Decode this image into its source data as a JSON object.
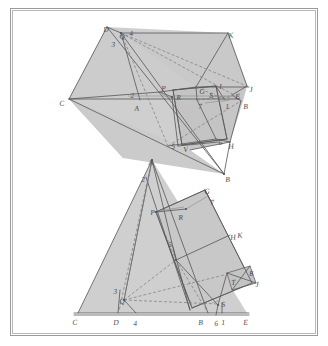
{
  "colors": {
    "paper": "#ffffff",
    "frame_outer": "#9a9a9a",
    "frame_inner": "#b8b8b8",
    "fill_gray": "#cfcfcf",
    "fill_gray_dark": "#c2c2c2",
    "stroke": "#555555",
    "stroke_light": "#808080",
    "label": "#4a4a4a"
  },
  "figures": [
    {
      "name": "upper-figure",
      "description": "Upper oblique projection: large quadrilateral prism with inscribed smaller prism and projection rays",
      "labels": [
        {
          "text": "D",
          "x": 103,
          "y": 26
        },
        {
          "text": "Q",
          "x": 119,
          "y": 33
        },
        {
          "text": "4",
          "x": 129,
          "y": 30
        },
        {
          "text": "3",
          "x": 111,
          "y": 41
        },
        {
          "text": "K",
          "x": 228,
          "y": 32
        },
        {
          "text": "C",
          "x": 59,
          "y": 100
        },
        {
          "text": "2",
          "x": 130,
          "y": 92
        },
        {
          "text": "A",
          "x": 134,
          "y": 105
        },
        {
          "text": "P",
          "x": 161,
          "y": 85
        },
        {
          "text": "R",
          "x": 176,
          "y": 94
        },
        {
          "text": "G",
          "x": 199,
          "y": 88
        },
        {
          "text": "S",
          "x": 209,
          "y": 92
        },
        {
          "text": "I",
          "x": 219,
          "y": 83
        },
        {
          "text": "E",
          "x": 235,
          "y": 93
        },
        {
          "text": "J",
          "x": 249,
          "y": 86
        },
        {
          "text": "B",
          "x": 243,
          "y": 103
        },
        {
          "text": "7",
          "x": 198,
          "y": 103
        },
        {
          "text": "1",
          "x": 225,
          "y": 103
        },
        {
          "text": "5",
          "x": 171,
          "y": 143
        },
        {
          "text": "V",
          "x": 183,
          "y": 146
        },
        {
          "text": "6",
          "x": 218,
          "y": 139
        },
        {
          "text": "H",
          "x": 228,
          "y": 143
        },
        {
          "text": "B",
          "x": 225,
          "y": 176
        }
      ]
    },
    {
      "name": "lower-figure",
      "description": "Lower orthographic projection: triangle on ground line with rotated rectangle and construction rays",
      "labels": [
        {
          "text": "A",
          "x": 148,
          "y": 159
        },
        {
          "text": "2",
          "x": 141,
          "y": 176
        },
        {
          "text": "G",
          "x": 204,
          "y": 188
        },
        {
          "text": "7",
          "x": 210,
          "y": 199
        },
        {
          "text": "P",
          "x": 150,
          "y": 209
        },
        {
          "text": "R",
          "x": 178,
          "y": 214
        },
        {
          "text": "H",
          "x": 230,
          "y": 234
        },
        {
          "text": "K",
          "x": 237,
          "y": 232
        },
        {
          "text": "5",
          "x": 168,
          "y": 241
        },
        {
          "text": "8",
          "x": 249,
          "y": 270
        },
        {
          "text": "T",
          "x": 231,
          "y": 279
        },
        {
          "text": "J",
          "x": 255,
          "y": 281
        },
        {
          "text": "3",
          "x": 113,
          "y": 288
        },
        {
          "text": "Q",
          "x": 119,
          "y": 298
        },
        {
          "text": "S",
          "x": 221,
          "y": 301
        },
        {
          "text": "C",
          "x": 72,
          "y": 319
        },
        {
          "text": "D",
          "x": 113,
          "y": 319
        },
        {
          "text": "4",
          "x": 133,
          "y": 320
        },
        {
          "text": "B",
          "x": 198,
          "y": 319
        },
        {
          "text": "6",
          "x": 214,
          "y": 320
        },
        {
          "text": "1",
          "x": 221,
          "y": 319
        },
        {
          "text": "E",
          "x": 243,
          "y": 319
        }
      ]
    }
  ]
}
